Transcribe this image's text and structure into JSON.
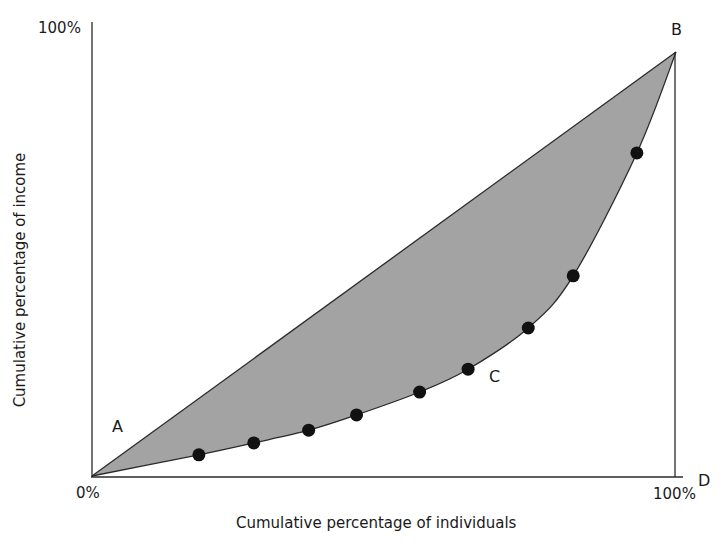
{
  "chart_data": {
    "type": "line",
    "title": "",
    "subtitle": "Lorenz curve",
    "xlabel": "Cumulative percentage of individuals",
    "ylabel": "Cumulative percentage of income",
    "xlim": [
      0,
      100
    ],
    "ylim": [
      0,
      100
    ],
    "x_tick_labels": [
      "0%",
      "100%"
    ],
    "y_tick_labels": [
      "0%",
      "100%"
    ],
    "grid": false,
    "legend": null,
    "series": [
      {
        "name": "Line of equality (A-B)",
        "style": "straight line",
        "x": [
          0,
          100
        ],
        "y": [
          0,
          100
        ]
      },
      {
        "name": "Lorenz curve (A-C-B)",
        "style": "curve with markers",
        "x": [
          0,
          18.3,
          27.7,
          37.1,
          45.3,
          56.1,
          64.4,
          74.7,
          82.4,
          93.3,
          100
        ],
        "y": [
          0,
          5.0,
          7.8,
          10.8,
          14.4,
          19.8,
          25.2,
          34.9,
          47.2,
          76.2,
          100
        ]
      }
    ],
    "markers": [
      {
        "x": 18.3,
        "y": 5.0
      },
      {
        "x": 27.7,
        "y": 7.8
      },
      {
        "x": 37.1,
        "y": 10.8
      },
      {
        "x": 45.3,
        "y": 14.4
      },
      {
        "x": 56.1,
        "y": 19.8
      },
      {
        "x": 64.4,
        "y": 25.2
      },
      {
        "x": 74.7,
        "y": 34.9
      },
      {
        "x": 82.4,
        "y": 47.2
      },
      {
        "x": 93.3,
        "y": 76.2
      }
    ],
    "shaded_region": "area between line of equality and Lorenz curve",
    "annotations": [
      {
        "text": "A",
        "position": "near origin, above the equality line"
      },
      {
        "text": "B",
        "position": "top-right corner (100%, 100%)"
      },
      {
        "text": "C",
        "position": "beside the Lorenz curve"
      },
      {
        "text": "D",
        "position": "bottom-right corner (100%, 0%)"
      }
    ]
  },
  "labels": {
    "y_top": "100%",
    "origin": "0%",
    "x_right": "100%",
    "point_a": "A",
    "point_b": "B",
    "point_c": "C",
    "point_d": "D",
    "x_title": "Cumulative percentage of individuals",
    "y_title": "Cumulative percentage of income"
  },
  "colors": {
    "fill": "#a3a3a3",
    "line": "#2a2a2a",
    "marker": "#111111",
    "background": "#ffffff"
  }
}
